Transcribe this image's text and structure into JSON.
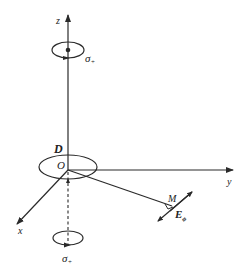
{
  "diagram": {
    "type": "3d-coordinate-system",
    "axes": {
      "x": {
        "label": "x"
      },
      "y": {
        "label": "y"
      },
      "z": {
        "label": "z"
      }
    },
    "origin_label": "O",
    "region_label": "D",
    "point_label": "M",
    "field_label": "E",
    "field_subscript": "ϕ",
    "polarization_labels": {
      "top": "σ",
      "top_sub": "+",
      "bottom": "σ",
      "bottom_sub": "+"
    },
    "colors": {
      "line": "#2a2a2a",
      "text": "#222222",
      "background": "#ffffff"
    }
  }
}
